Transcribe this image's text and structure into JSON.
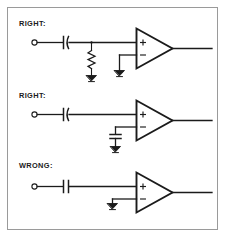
{
  "figure": {
    "kind": "schematic-diagram",
    "background_color": "#ffffff",
    "ink_color": "#1b1b1b",
    "frame_color": "#9a9a9a"
  },
  "sections": [
    {
      "id": "section-right-top",
      "label": "RIGHT:",
      "verdict": "right",
      "components": [
        "input-terminal",
        "series-capacitor",
        "shunt-resistor-to-ground",
        "opamp",
        "minus-input-ground",
        "output-line"
      ]
    },
    {
      "id": "section-right-middle",
      "label": "RIGHT:",
      "verdict": "right",
      "components": [
        "input-terminal",
        "series-capacitor",
        "opamp",
        "minus-input-capacitor-to-ground",
        "output-line"
      ]
    },
    {
      "id": "section-wrong-bottom",
      "label": "WRONG:",
      "verdict": "wrong",
      "components": [
        "input-terminal",
        "series-capacitor",
        "opamp",
        "minus-input-direct-ground",
        "output-line"
      ]
    }
  ],
  "opamp": {
    "plus_symbol": "+",
    "minus_symbol": "−"
  }
}
